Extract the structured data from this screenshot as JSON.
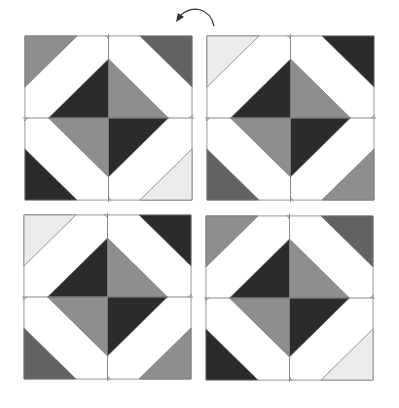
{
  "figure": {
    "rotation_arrow": {
      "icon": "curved-arrow-counterclockwise-icon",
      "direction": "counterclockwise"
    },
    "colors": {
      "dark": "#2b2b2b",
      "darkmid": "#626262",
      "mid": "#8e8e8e",
      "light": "#ebebeb",
      "white": "#ffffff",
      "outline": "#7a7a7a"
    },
    "blocks": [
      {
        "id": "top-left",
        "position": {
          "left": 23,
          "top": 34
        },
        "corners": {
          "tl": "mid",
          "tr": "darkmid",
          "bl": "dark",
          "br": "light"
        },
        "diamond": {
          "tl": "dark",
          "tr": "mid",
          "bl": "mid",
          "br": "dark"
        }
      },
      {
        "id": "top-right",
        "position": {
          "left": 205,
          "top": 34
        },
        "corners": {
          "tl": "light",
          "tr": "dark",
          "bl": "darkmid",
          "br": "mid"
        },
        "diamond": {
          "tl": "dark",
          "tr": "mid",
          "bl": "mid",
          "br": "dark"
        }
      },
      {
        "id": "bottom-left",
        "position": {
          "left": 22,
          "top": 213
        },
        "corners": {
          "tl": "light",
          "tr": "dark",
          "bl": "darkmid",
          "br": "mid"
        },
        "diamond": {
          "tl": "dark",
          "tr": "mid",
          "bl": "mid",
          "br": "dark"
        }
      },
      {
        "id": "bottom-right",
        "position": {
          "left": 204,
          "top": 214
        },
        "corners": {
          "tl": "mid",
          "tr": "darkmid",
          "bl": "dark",
          "br": "light"
        },
        "diamond": {
          "tl": "dark",
          "tr": "mid",
          "bl": "mid",
          "br": "dark"
        }
      }
    ],
    "geometry": {
      "block_size": 170,
      "corner_leg": 53,
      "diamond_half_diagonal": 61
    }
  }
}
